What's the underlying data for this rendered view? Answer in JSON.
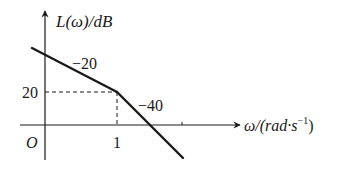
{
  "diagram": {
    "type": "bode-magnitude-asymptote",
    "y_axis_label": {
      "main": "L(ω)/dB"
    },
    "x_axis_label": {
      "prefix": "ω/(rad·s",
      "exp": "−1",
      "suffix": ")"
    },
    "origin_label": "O",
    "x_tick_label": "1",
    "y_tick_label": "20",
    "segments": [
      {
        "slope_label": "−20",
        "from": "low freq",
        "to": "ω=1"
      },
      {
        "slope_label": "−40",
        "from": "ω=1",
        "to": "high freq"
      }
    ],
    "break_point": {
      "omega": 1,
      "L_dB": 20
    },
    "colors": {
      "ink": "#1a1a1a",
      "background": "#ffffff"
    }
  }
}
